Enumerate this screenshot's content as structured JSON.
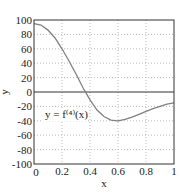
{
  "chart_data": {
    "type": "line",
    "title": "",
    "xlabel": "x",
    "ylabel": "y",
    "xlim": [
      0,
      1
    ],
    "ylim": [
      -100,
      100
    ],
    "grid": true,
    "x_ticks": [
      "0",
      "0.2",
      "0.4",
      "0.6",
      "0.8",
      "1"
    ],
    "y_ticks": [
      "100",
      "80",
      "60",
      "40",
      "20",
      "0",
      "-20",
      "-40",
      "-60",
      "-80",
      "-100"
    ],
    "annotation": "y = f⁽⁴⁾(x)",
    "series": [
      {
        "name": "f^(4)(x)",
        "color": "#808080",
        "x": [
          0,
          0.05,
          0.1,
          0.15,
          0.2,
          0.25,
          0.3,
          0.35,
          0.4,
          0.45,
          0.5,
          0.55,
          0.6,
          0.65,
          0.7,
          0.75,
          0.8,
          0.85,
          0.9,
          0.95,
          1.0
        ],
        "y": [
          95,
          93,
          86,
          75,
          60,
          43,
          25,
          6,
          -11,
          -25,
          -34,
          -39,
          -40,
          -38,
          -35,
          -31,
          -27,
          -23,
          -20,
          -17,
          -15
        ]
      }
    ],
    "zero_line": true
  }
}
